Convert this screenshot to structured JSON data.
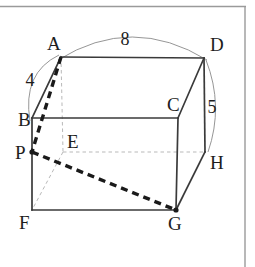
{
  "figure": {
    "type": "geometry-diagram",
    "frame": {
      "top_border": true,
      "right_border": true,
      "bottom_border": false,
      "left_border": false,
      "color": "#9a9a9a"
    },
    "colors": {
      "solid_edge": "#3a3a3a",
      "hidden_edge": "#b9b9b9",
      "bold_dashed": "#1a1a1a",
      "arc": "#8a8a8a",
      "label": "#1d1d1d",
      "background": "#ffffff"
    },
    "vertices": [
      {
        "name": "A",
        "x": 61,
        "y": 57,
        "label": "A",
        "label_x": 47,
        "label_y": 50,
        "hidden": false
      },
      {
        "name": "B",
        "x": 32,
        "y": 118,
        "label": "B",
        "label_x": 18,
        "label_y": 126,
        "hidden": false
      },
      {
        "name": "C",
        "x": 178,
        "y": 118,
        "label": "C",
        "label_x": 167,
        "label_y": 111,
        "hidden": false
      },
      {
        "name": "D",
        "x": 204,
        "y": 58,
        "label": "D",
        "label_x": 210,
        "label_y": 51,
        "hidden": false
      },
      {
        "name": "E",
        "x": 63,
        "y": 152,
        "label": "E",
        "label_x": 67,
        "label_y": 148,
        "hidden": true
      },
      {
        "name": "F",
        "x": 32,
        "y": 210,
        "label": "F",
        "label_x": 19,
        "label_y": 229,
        "hidden": false
      },
      {
        "name": "G",
        "x": 176,
        "y": 210,
        "label": "G",
        "label_x": 168,
        "label_y": 230,
        "hidden": false
      },
      {
        "name": "H",
        "x": 205,
        "y": 152,
        "label": "H",
        "label_x": 210,
        "label_y": 169,
        "hidden": false
      },
      {
        "name": "P",
        "x": 32,
        "y": 152,
        "label": "P",
        "label_x": 15,
        "label_y": 159,
        "hidden": false
      }
    ],
    "solid_edges": [
      {
        "from": "A",
        "to": "D",
        "name": "edge-AD"
      },
      {
        "from": "A",
        "to": "B",
        "name": "edge-AB"
      },
      {
        "from": "B",
        "to": "C",
        "name": "edge-BC"
      },
      {
        "from": "C",
        "to": "D",
        "name": "edge-CD"
      },
      {
        "from": "C",
        "to": "G",
        "name": "edge-CG"
      },
      {
        "from": "D",
        "to": "H",
        "name": "edge-DH"
      },
      {
        "from": "B",
        "to": "F",
        "name": "edge-BF"
      },
      {
        "from": "F",
        "to": "G",
        "name": "edge-FG"
      },
      {
        "from": "G",
        "to": "H",
        "name": "edge-GH"
      }
    ],
    "hidden_edges": [
      {
        "from": "A",
        "to": "E",
        "name": "edge-AE"
      },
      {
        "from": "E",
        "to": "F",
        "name": "edge-EF"
      },
      {
        "from": "E",
        "to": "H",
        "name": "edge-EH"
      }
    ],
    "bold_dashed_edges": [
      {
        "from": "A",
        "to": "P",
        "name": "segment-AP"
      },
      {
        "from": "P",
        "to": "G",
        "name": "segment-PG"
      }
    ],
    "marked_points": [
      {
        "name": "point-P",
        "x": 32,
        "y": 152
      },
      {
        "name": "point-G",
        "x": 176,
        "y": 210
      }
    ],
    "measure_arcs": [
      {
        "name": "arc-AD",
        "value": "8",
        "from": "A",
        "to": "D",
        "path": "M 58 60 Q 132 14 207 60",
        "label_x": 125,
        "label_y": 45
      },
      {
        "name": "arc-BA",
        "value": "4",
        "from": "B",
        "to": "A",
        "path": "M 30 121 Q 22 73 59 55",
        "label_x": 30,
        "label_y": 86
      },
      {
        "name": "arc-DH",
        "value": "5",
        "from": "D",
        "to": "H",
        "path": "M 206 60 Q 224 106 208 152",
        "label_x": 212,
        "label_y": 113
      }
    ],
    "measures": [
      {
        "name": "measure-8",
        "edge": "AD",
        "value": "8"
      },
      {
        "name": "measure-4",
        "edge": "BA",
        "value": "4"
      },
      {
        "name": "measure-5",
        "edge": "DH",
        "value": "5"
      }
    ]
  }
}
